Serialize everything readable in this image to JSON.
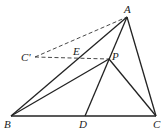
{
  "diagram": {
    "type": "geometry",
    "points": {
      "A": {
        "label": "A",
        "x": 127,
        "y": 17,
        "lx": 124,
        "ly": 13
      },
      "B": {
        "label": "B",
        "x": 11,
        "y": 116,
        "lx": 4,
        "ly": 128
      },
      "C": {
        "label": "C",
        "x": 156,
        "y": 116,
        "lx": 153,
        "ly": 128
      },
      "D": {
        "label": "D",
        "x": 85,
        "y": 116,
        "lx": 79,
        "ly": 128
      },
      "P": {
        "label": "P",
        "x": 109,
        "y": 59,
        "lx": 112,
        "ly": 60
      },
      "E": {
        "label": "E",
        "x": 77,
        "y": 59,
        "lx": 73,
        "ly": 55
      },
      "Cp": {
        "label": "C'",
        "x": 35,
        "y": 57,
        "lx": 21,
        "ly": 61
      }
    },
    "solid_segments": [
      [
        "A",
        "B"
      ],
      [
        "A",
        "C"
      ],
      [
        "B",
        "C"
      ],
      [
        "A",
        "D"
      ],
      [
        "B",
        "P"
      ],
      [
        "P",
        "C"
      ]
    ],
    "dashed_segments": [
      [
        "Cp",
        "A"
      ],
      [
        "Cp",
        "P"
      ]
    ]
  }
}
